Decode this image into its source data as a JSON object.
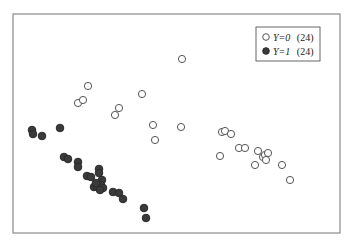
{
  "chart_data": {
    "type": "scatter",
    "title": "",
    "xlabel": "",
    "ylabel": "",
    "grid": false,
    "legend_position": "upper-right",
    "axes_visible": false,
    "pixel_frame": {
      "x0": 13,
      "y0": 14,
      "x1": 340,
      "y1": 233
    },
    "series": [
      {
        "name": "Y=0 (24)",
        "label_var": "Y=0",
        "label_count": "(24)",
        "marker": "open-circle",
        "color": "#555555",
        "points": [
          [
            182,
            59
          ],
          [
            88,
            86
          ],
          [
            78,
            103
          ],
          [
            83,
            100
          ],
          [
            142,
            94
          ],
          [
            119,
            108
          ],
          [
            115,
            115
          ],
          [
            153,
            125
          ],
          [
            181,
            127
          ],
          [
            155,
            140
          ],
          [
            222,
            132
          ],
          [
            225,
            131
          ],
          [
            231,
            134
          ],
          [
            239,
            148
          ],
          [
            245,
            148
          ],
          [
            258,
            151
          ],
          [
            220,
            156
          ],
          [
            255,
            165
          ],
          [
            263,
            157
          ],
          [
            265,
            155
          ],
          [
            268,
            153
          ],
          [
            266,
            160
          ],
          [
            282,
            165
          ],
          [
            290,
            180
          ]
        ]
      },
      {
        "name": "Y=1 (24)",
        "label_var": "Y=1",
        "label_count": "(24)",
        "marker": "filled-circle",
        "color": "#3a3a3a",
        "points": [
          [
            32,
            130
          ],
          [
            33,
            134
          ],
          [
            42,
            136
          ],
          [
            60,
            128
          ],
          [
            64,
            157
          ],
          [
            68,
            159
          ],
          [
            78,
            162
          ],
          [
            78,
            167
          ],
          [
            87,
            176
          ],
          [
            91,
            177
          ],
          [
            99,
            169
          ],
          [
            99,
            173
          ],
          [
            102,
            180
          ],
          [
            94,
            187
          ],
          [
            97,
            187
          ],
          [
            101,
            185
          ],
          [
            103,
            188
          ],
          [
            96,
            183
          ],
          [
            100,
            190
          ],
          [
            113,
            192
          ],
          [
            119,
            193
          ],
          [
            123,
            199
          ],
          [
            144,
            208
          ],
          [
            146,
            218
          ]
        ]
      }
    ]
  },
  "legend": {
    "items": [
      {
        "var": "Y=0",
        "count": "(24)"
      },
      {
        "var": "Y=1",
        "count": "(24)"
      }
    ]
  }
}
